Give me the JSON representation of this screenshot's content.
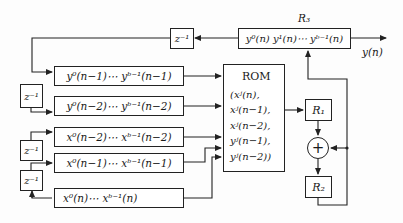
{
  "diagram": {
    "type": "block-diagram",
    "delays": {
      "feedback_top": "z⁻¹",
      "y_delay": "z⁻¹",
      "x_delay_1": "z⁻¹",
      "x_delay_2": "z⁻¹"
    },
    "registers": {
      "r3_label": "R₃",
      "r3_content": "y⁰(n) y¹(n)⋯ yᵇ⁻¹(n)",
      "r1": "R₁",
      "r2": "R₂"
    },
    "output_label": "y(n)",
    "shift_registers": [
      {
        "id": "y_n_minus_1",
        "text": "y⁰(n−1)⋯ yᵇ⁻¹(n−1)"
      },
      {
        "id": "y_n_minus_2",
        "text": "y⁰(n−2)⋯ yᵇ⁻¹(n−2)"
      },
      {
        "id": "x_n_minus_2",
        "text": "x⁰(n−2)⋯ xᵇ⁻¹(n−2)"
      },
      {
        "id": "x_n_minus_1",
        "text": "x⁰(n−1)⋯ xᵇ⁻¹(n−1)"
      },
      {
        "id": "x_n",
        "text": "x⁰(n)⋯ xᵇ⁻¹(n)"
      }
    ],
    "rom": {
      "title": "ROM",
      "lines": [
        "(xʲ(n),",
        "xʲ(n−1),",
        "xʲ(n−2),",
        "yʲ(n−1),",
        "yʲ(n−2))"
      ]
    },
    "adder_symbol": "+"
  }
}
